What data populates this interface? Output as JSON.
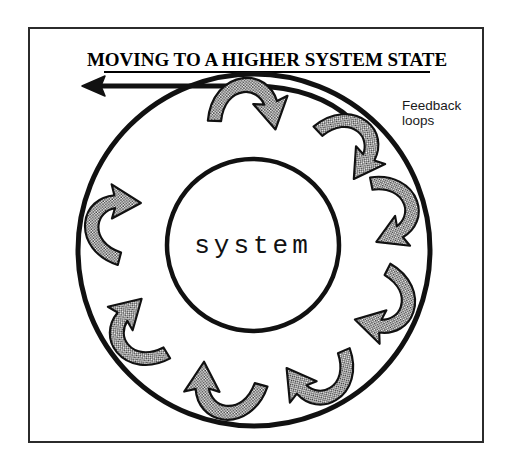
{
  "canvas": {
    "width": 512,
    "height": 467,
    "background": "#ffffff"
  },
  "frame": {
    "name": "outer-border",
    "x": 29,
    "y": 28,
    "width": 454,
    "height": 414,
    "stroke": "#2b2b2b",
    "stroke_width": 2
  },
  "title": {
    "text": "MOVING TO A HIGHER SYSTEM STATE",
    "x": 267,
    "y": 66,
    "font_size": 19,
    "underline": true,
    "color": "#000000",
    "underline_x1": 104,
    "underline_x2": 430,
    "underline_y": 72
  },
  "progress_arrow": {
    "name": "moving-to-higher-state-arrow",
    "description": "heavy black arrow pointing left along the top of the outer ring",
    "direction": "left",
    "tip_x": 82,
    "tip_y": 86,
    "tail_x": 250,
    "tail_y": 86,
    "color": "#111111",
    "stroke_width": 5
  },
  "outer_circle": {
    "name": "system-boundary-circle",
    "cx": 254,
    "cy": 250,
    "r": 176,
    "stroke": "#111111",
    "stroke_width": 5,
    "fill": "none"
  },
  "inner_circle": {
    "name": "system-core-circle",
    "cx": 253,
    "cy": 245,
    "r": 86,
    "stroke": "#111111",
    "stroke_width": 4.5,
    "fill": "#ffffff"
  },
  "center_label": {
    "text": "system",
    "x": 253,
    "y": 253,
    "font_size": 26,
    "letter_spacing": 4,
    "color": "#111111"
  },
  "feedback_label": {
    "lines": [
      "Feedback",
      "loops"
    ],
    "x": 402,
    "y": 110,
    "line_height": 15,
    "font_size": 13.5,
    "color": "#1a1a1a"
  },
  "arrows": {
    "name": "feedback-loop-arrows",
    "count": 8,
    "fill": "#a9a9a9",
    "pattern": "halftone-checker",
    "stroke": "#111111",
    "stroke_width": 2.2,
    "orbit_radius": 131,
    "items": [
      {
        "id": "feedback-arrow-1",
        "angle_deg": -97,
        "rotate_deg": -97,
        "scale": 1.0,
        "label": "top"
      },
      {
        "id": "feedback-arrow-2",
        "angle_deg": -52,
        "rotate_deg": -52,
        "scale": 0.97,
        "label": "upper-right"
      },
      {
        "id": "feedback-arrow-3",
        "angle_deg": -20,
        "rotate_deg": -20,
        "scale": 0.95,
        "label": "right-upper"
      },
      {
        "id": "feedback-arrow-4",
        "angle_deg": 18,
        "rotate_deg": 18,
        "scale": 0.97,
        "label": "right-lower"
      },
      {
        "id": "feedback-arrow-5",
        "angle_deg": 58,
        "rotate_deg": 58,
        "scale": 0.97,
        "label": "lower-right"
      },
      {
        "id": "feedback-arrow-6",
        "angle_deg": 97,
        "rotate_deg": 97,
        "scale": 1.0,
        "label": "bottom"
      },
      {
        "id": "feedback-arrow-7",
        "angle_deg": 140,
        "rotate_deg": 140,
        "scale": 0.97,
        "label": "lower-left"
      },
      {
        "id": "feedback-arrow-8",
        "angle_deg": 186,
        "rotate_deg": 186,
        "scale": 0.97,
        "label": "left"
      }
    ]
  }
}
